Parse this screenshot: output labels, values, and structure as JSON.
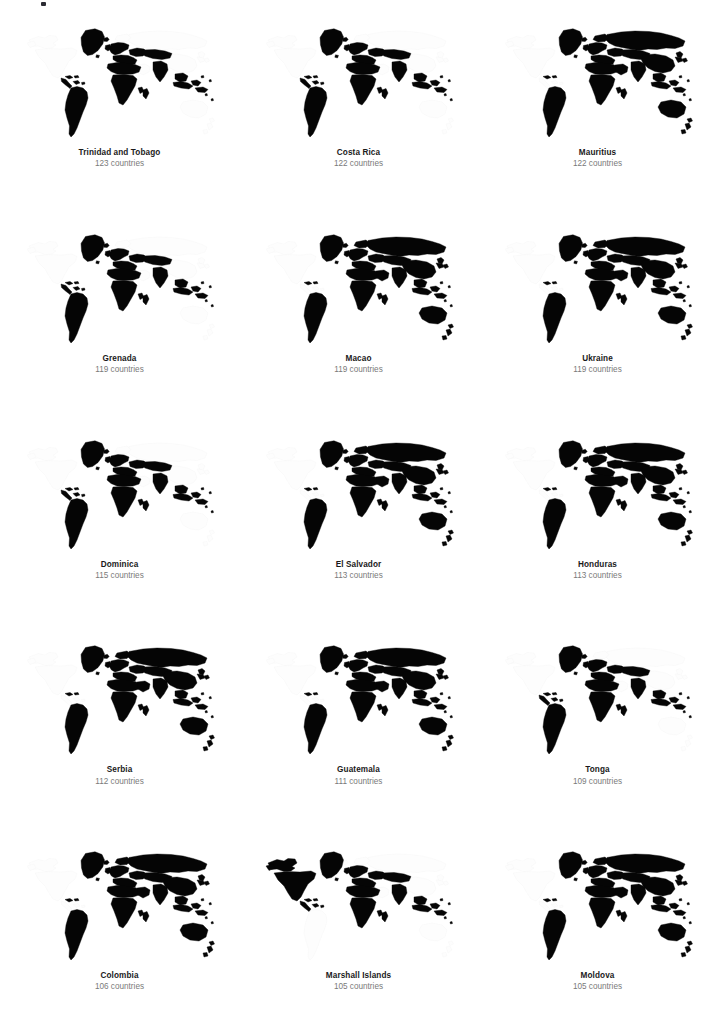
{
  "figure": {
    "type": "small-multiples-world-maps",
    "columns": 3,
    "rows": 5,
    "count_unit": "countries",
    "selected_color": "#050505",
    "unselected_color": "#fdfdfd",
    "name_color": "#1a1a1a",
    "count_color": "#7a7a7a"
  },
  "chart_data": {
    "type": "map",
    "title": "",
    "subtitle": "",
    "xlabel": "",
    "ylabel": "",
    "legend": [],
    "grid": false,
    "categories": [
      "Trinidad and Tobago",
      "Costa Rica",
      "Mauritius",
      "Grenada",
      "Macao",
      "Ukraine",
      "Dominica",
      "El Salvador",
      "Honduras",
      "Serbia",
      "Guatemala",
      "Tonga",
      "Colombia",
      "Marshall Islands",
      "Moldova"
    ],
    "values": [
      123,
      122,
      122,
      119,
      119,
      119,
      115,
      113,
      113,
      112,
      111,
      109,
      106,
      105,
      105
    ],
    "value_labels": [
      "123 countries",
      "122 countries",
      "122 countries",
      "119 countries",
      "119 countries",
      "119 countries",
      "115 countries",
      "113 countries",
      "113 countries",
      "112 countries",
      "111 countries",
      "109 countries",
      "106 countries",
      "105 countries",
      "105 countries"
    ]
  },
  "panels": [
    {
      "name": "Trinidad and Tobago",
      "count_label": "123 countries",
      "count": 123,
      "pattern": "americas-europe-africa-sea"
    },
    {
      "name": "Costa Rica",
      "count_label": "122 countries",
      "count": 122,
      "pattern": "americas-europe-africa-sea"
    },
    {
      "name": "Mauritius",
      "count_label": "122 countries",
      "count": 122,
      "pattern": "eurasia-heavy"
    },
    {
      "name": "Grenada",
      "count_label": "119 countries",
      "count": 119,
      "pattern": "americas-europe-asia-light"
    },
    {
      "name": "Macao",
      "count_label": "119 countries",
      "count": 119,
      "pattern": "eurasia-heavy"
    },
    {
      "name": "Ukraine",
      "count_label": "119 countries",
      "count": 119,
      "pattern": "eurasia-heavy"
    },
    {
      "name": "Dominica",
      "count_label": "115 countries",
      "count": 115,
      "pattern": "americas-europe-asia-light"
    },
    {
      "name": "El Salvador",
      "count_label": "113 countries",
      "count": 113,
      "pattern": "eurasia-heavy"
    },
    {
      "name": "Honduras",
      "count_label": "113 countries",
      "count": 113,
      "pattern": "eurasia-heavy"
    },
    {
      "name": "Serbia",
      "count_label": "112 countries",
      "count": 112,
      "pattern": "eurasia-heavy"
    },
    {
      "name": "Guatemala",
      "count_label": "111 countries",
      "count": 111,
      "pattern": "eurasia-heavy"
    },
    {
      "name": "Tonga",
      "count_label": "109 countries",
      "count": 109,
      "pattern": "americas-europe-asia-light"
    },
    {
      "name": "Colombia",
      "count_label": "106 countries",
      "count": 106,
      "pattern": "eurasia-heavy"
    },
    {
      "name": "Marshall Islands",
      "count_label": "105 countries",
      "count": 105,
      "pattern": "sparse-islands"
    },
    {
      "name": "Moldova",
      "count_label": "105 countries",
      "count": 105,
      "pattern": "eurasia-heavy"
    }
  ]
}
